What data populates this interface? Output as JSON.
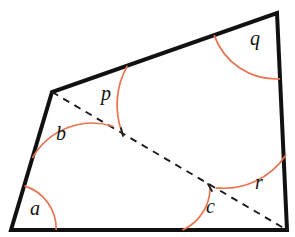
{
  "figure": {
    "kind": "geometry-diagram",
    "canvas": {
      "width": 295,
      "height": 237
    },
    "colors": {
      "background": "#ffffff",
      "outline": "#111111",
      "diagonal": "#1a1a1a",
      "arc": "#e8734f",
      "label": "#111111"
    },
    "vertices": [
      {
        "name": "bottom-left",
        "x": 11,
        "y": 230
      },
      {
        "name": "upper-left",
        "x": 52,
        "y": 92
      },
      {
        "name": "top-right",
        "x": 277,
        "y": 13
      },
      {
        "name": "bottom-right",
        "x": 287,
        "y": 230
      }
    ],
    "outline_path": "M 11,230 L 52,92 L 277,13 L 287,230 Z",
    "diagonal": {
      "from": {
        "x": 52,
        "y": 92
      },
      "to": {
        "x": 287,
        "y": 230
      },
      "style": "dashed"
    },
    "arcs": [
      {
        "id": "a",
        "vertex": "bottom-left",
        "path": "M 56.2,230 A 45,45 0 0 0 24.4,185.9"
      },
      {
        "id": "b",
        "vertex": "upper-left",
        "path": "M 113.7,126.5 A 69,69 0 0 0 32.4,158.0"
      },
      {
        "id": "p",
        "vertex": "upper-left",
        "path": "M 127.3,65.8 A 80,80 0 0 0 122.0,132.6"
      },
      {
        "id": "q",
        "vertex": "top-right",
        "path": "M 214.1,35.1 A 66,66 0 0 0 280.1,78.9"
      },
      {
        "id": "c",
        "vertex": "bottom-c",
        "path": "M 182.5,230 A 47,47 0 0 0 210.1,187.9"
      },
      {
        "id": "r",
        "vertex": "bottom-right",
        "path": "M 215.6,187.8 A 75,75 0 0 0 286.0,155.0"
      }
    ],
    "ticks": [
      {
        "id": "p-end-tick",
        "x1": 121,
        "y1": 128,
        "x2": 123,
        "y2": 136
      },
      {
        "id": "c-end-tick",
        "x1": 208,
        "y1": 184,
        "x2": 212,
        "y2": 191
      }
    ],
    "labels": [
      {
        "id": "a",
        "text": "a",
        "x": 30,
        "y": 198
      },
      {
        "id": "b",
        "text": "b",
        "x": 56,
        "y": 123
      },
      {
        "id": "p",
        "text": "p",
        "x": 101,
        "y": 83
      },
      {
        "id": "q",
        "text": "q",
        "x": 250,
        "y": 28
      },
      {
        "id": "c",
        "text": "c",
        "x": 206,
        "y": 196
      },
      {
        "id": "r",
        "text": "r",
        "x": 255,
        "y": 172
      }
    ]
  }
}
